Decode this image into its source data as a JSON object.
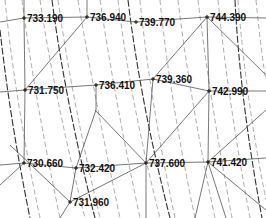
{
  "diagram": {
    "type": "tin-contour-map",
    "background": "#ffffff",
    "line_color": "#555555",
    "contour_color": "#777777",
    "points": [
      {
        "label": "733.190",
        "x": 24,
        "y": 18
      },
      {
        "label": "736.940",
        "x": 87,
        "y": 17
      },
      {
        "label": "739.770",
        "x": 136,
        "y": 22
      },
      {
        "label": "744.390",
        "x": 207,
        "y": 17
      },
      {
        "label": "731.750",
        "x": 25,
        "y": 90
      },
      {
        "label": "736.410",
        "x": 96,
        "y": 85
      },
      {
        "label": "739.360",
        "x": 153,
        "y": 79
      },
      {
        "label": "742.990",
        "x": 209,
        "y": 91
      },
      {
        "label": "730.660",
        "x": 24,
        "y": 163
      },
      {
        "label": "732.420",
        "x": 76,
        "y": 168
      },
      {
        "label": "737.600",
        "x": 146,
        "y": 163
      },
      {
        "label": "741.420",
        "x": 208,
        "y": 162
      },
      {
        "label": "731.960",
        "x": 70,
        "y": 202
      }
    ]
  }
}
